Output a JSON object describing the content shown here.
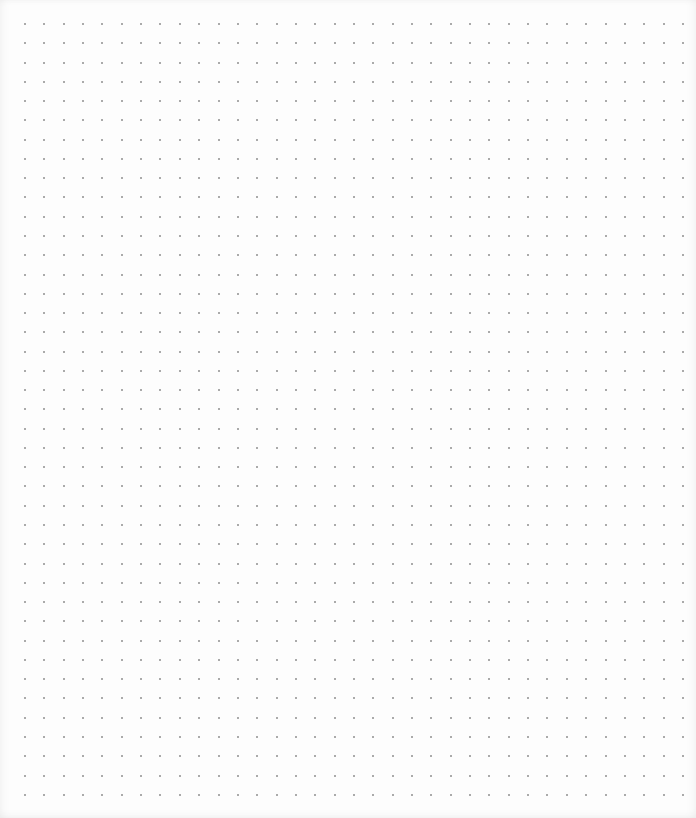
{
  "page": {
    "type": "dot-grid-sheet",
    "background_color": "#fdfdfd",
    "dot_color": "#6a6a6a"
  },
  "grid": {
    "columns": 35,
    "rows": 41,
    "origin_x": 25,
    "origin_y": 24,
    "spacing_x": 19.35,
    "spacing_y": 19.27,
    "dot_size": 2
  }
}
